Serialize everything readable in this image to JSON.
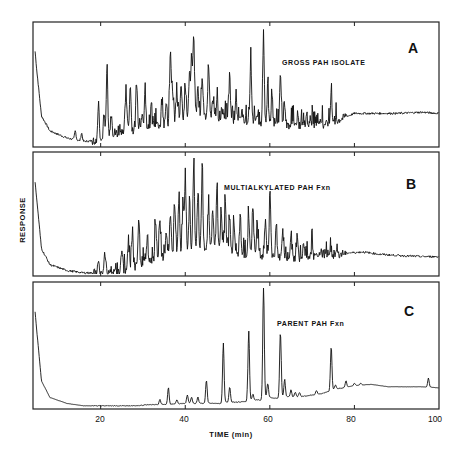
{
  "figure": {
    "ylabel": "RESPONSE",
    "xlabel": "TIME (min)",
    "x_ticks": [
      "20",
      "40",
      "60",
      "80",
      "100"
    ]
  },
  "panels": [
    {
      "letter": "A",
      "title": "GROSS PAH ISOLATE"
    },
    {
      "letter": "B",
      "title": "MULTIALKYLATED PAH Fxn"
    },
    {
      "letter": "C",
      "title": "PARENT PAH Fxn"
    }
  ],
  "chart_data": [
    {
      "type": "line",
      "title": "GROSS PAH ISOLATE",
      "panel": "A",
      "xlabel": "TIME (min)",
      "ylabel": "RESPONSE",
      "xlim": [
        4,
        100
      ],
      "ylim": [
        0,
        100
      ],
      "x_ticks": [
        20,
        40,
        60,
        80,
        100
      ],
      "grid": false,
      "baseline": [
        [
          4,
          100
        ],
        [
          5,
          60
        ],
        [
          6,
          25
        ],
        [
          8,
          12
        ],
        [
          12,
          6
        ],
        [
          16,
          3
        ],
        [
          20,
          4
        ],
        [
          24,
          10
        ],
        [
          30,
          14
        ],
        [
          36,
          18
        ],
        [
          40,
          24
        ],
        [
          44,
          25
        ],
        [
          50,
          22
        ],
        [
          56,
          20
        ],
        [
          64,
          17
        ],
        [
          72,
          17
        ],
        [
          76,
          21
        ],
        [
          80,
          27
        ],
        [
          84,
          27
        ],
        [
          90,
          27
        ],
        [
          96,
          28
        ],
        [
          100,
          27
        ]
      ],
      "peaks": [
        [
          14,
          12
        ],
        [
          15.5,
          10
        ],
        [
          19.5,
          36
        ],
        [
          20.8,
          26
        ],
        [
          21.5,
          66
        ],
        [
          22.5,
          22
        ],
        [
          26,
          44
        ],
        [
          27,
          48
        ],
        [
          28.5,
          50
        ],
        [
          30.5,
          46
        ],
        [
          32,
          26
        ],
        [
          34.5,
          30
        ],
        [
          35.5,
          36
        ],
        [
          36.5,
          80
        ],
        [
          37,
          46
        ],
        [
          38,
          42
        ],
        [
          39,
          50
        ],
        [
          40,
          42
        ],
        [
          41,
          60
        ],
        [
          41.5,
          66
        ],
        [
          42,
          92
        ],
        [
          43,
          50
        ],
        [
          44,
          60
        ],
        [
          45.5,
          68
        ],
        [
          46.5,
          40
        ],
        [
          47.5,
          36
        ],
        [
          49,
          28
        ],
        [
          50.5,
          58
        ],
        [
          52,
          38
        ],
        [
          55.5,
          70
        ],
        [
          57,
          28
        ],
        [
          58.5,
          87
        ],
        [
          59.5,
          46
        ],
        [
          60.5,
          42
        ],
        [
          62.5,
          60
        ],
        [
          63.5,
          36
        ],
        [
          65.5,
          24
        ],
        [
          70,
          20
        ],
        [
          71,
          18
        ],
        [
          74.5,
          42
        ],
        [
          78,
          26
        ]
      ]
    },
    {
      "type": "line",
      "title": "MULTIALKYLATED PAH Fxn",
      "panel": "B",
      "xlabel": "TIME (min)",
      "ylabel": "RESPONSE",
      "xlim": [
        4,
        100
      ],
      "ylim": [
        0,
        100
      ],
      "x_ticks": [
        20,
        40,
        60,
        80,
        100
      ],
      "grid": false,
      "baseline": [
        [
          4,
          100
        ],
        [
          5,
          60
        ],
        [
          6,
          22
        ],
        [
          8,
          8
        ],
        [
          12,
          3
        ],
        [
          16,
          1
        ],
        [
          20,
          1
        ],
        [
          24,
          2
        ],
        [
          28,
          6
        ],
        [
          32,
          12
        ],
        [
          36,
          16
        ],
        [
          40,
          22
        ],
        [
          44,
          22
        ],
        [
          50,
          18
        ],
        [
          56,
          16
        ],
        [
          62,
          15
        ],
        [
          66,
          13
        ],
        [
          70,
          14
        ],
        [
          74,
          16
        ],
        [
          78,
          18
        ],
        [
          82,
          19
        ],
        [
          86,
          17
        ],
        [
          90,
          16
        ],
        [
          96,
          15
        ],
        [
          100,
          15
        ]
      ],
      "peaks": [
        [
          19.5,
          8
        ],
        [
          21,
          14
        ],
        [
          25,
          20
        ],
        [
          26.5,
          26
        ],
        [
          27.5,
          32
        ],
        [
          29,
          40
        ],
        [
          31,
          26
        ],
        [
          33,
          42
        ],
        [
          34,
          44
        ],
        [
          35.5,
          36
        ],
        [
          36.5,
          50
        ],
        [
          37.5,
          58
        ],
        [
          38.5,
          60
        ],
        [
          39.5,
          58
        ],
        [
          40,
          75
        ],
        [
          41,
          55
        ],
        [
          42,
          92
        ],
        [
          43,
          70
        ],
        [
          44,
          86
        ],
        [
          45.5,
          58
        ],
        [
          46.5,
          56
        ],
        [
          47.5,
          70
        ],
        [
          48.5,
          55
        ],
        [
          49.5,
          62
        ],
        [
          50.5,
          48
        ],
        [
          51.5,
          42
        ],
        [
          53,
          40
        ],
        [
          55,
          50
        ],
        [
          56,
          58
        ],
        [
          57,
          42
        ],
        [
          59,
          46
        ],
        [
          60,
          60
        ],
        [
          61.5,
          40
        ],
        [
          63,
          36
        ],
        [
          65,
          34
        ],
        [
          66.5,
          30
        ],
        [
          68,
          28
        ],
        [
          70,
          26
        ],
        [
          72,
          22
        ]
      ]
    },
    {
      "type": "line",
      "title": "PARENT PAH Fxn",
      "panel": "C",
      "xlabel": "TIME (min)",
      "ylabel": "RESPONSE",
      "xlim": [
        4,
        100
      ],
      "ylim": [
        0,
        100
      ],
      "x_ticks": [
        20,
        40,
        60,
        80,
        100
      ],
      "grid": false,
      "baseline": [
        [
          4,
          100
        ],
        [
          5,
          60
        ],
        [
          6,
          22
        ],
        [
          8,
          8
        ],
        [
          12,
          3
        ],
        [
          16,
          1
        ],
        [
          20,
          1
        ],
        [
          28,
          1
        ],
        [
          32,
          2
        ],
        [
          36,
          2
        ],
        [
          40,
          3
        ],
        [
          44,
          3
        ],
        [
          48,
          3
        ],
        [
          52,
          4
        ],
        [
          56,
          5
        ],
        [
          60,
          7
        ],
        [
          64,
          8
        ],
        [
          68,
          9
        ],
        [
          72,
          11
        ],
        [
          76,
          15
        ],
        [
          80,
          18
        ],
        [
          84,
          19
        ],
        [
          88,
          17
        ],
        [
          92,
          17
        ],
        [
          96,
          17
        ],
        [
          100,
          16
        ]
      ],
      "peaks": [
        [
          34,
          6
        ],
        [
          36,
          16
        ],
        [
          38,
          6
        ],
        [
          40.5,
          10
        ],
        [
          41.5,
          8
        ],
        [
          43,
          8
        ],
        [
          45,
          22
        ],
        [
          49,
          52
        ],
        [
          50.5,
          16
        ],
        [
          55,
          62
        ],
        [
          56,
          10
        ],
        [
          58.5,
          100
        ],
        [
          59.5,
          18
        ],
        [
          62.5,
          62
        ],
        [
          63.5,
          22
        ],
        [
          65,
          14
        ],
        [
          66,
          12
        ],
        [
          67,
          12
        ],
        [
          71,
          14
        ],
        [
          74.5,
          50
        ],
        [
          75.5,
          18
        ],
        [
          78,
          22
        ],
        [
          80,
          20
        ],
        [
          81.5,
          20
        ],
        [
          97.5,
          24
        ]
      ]
    }
  ]
}
